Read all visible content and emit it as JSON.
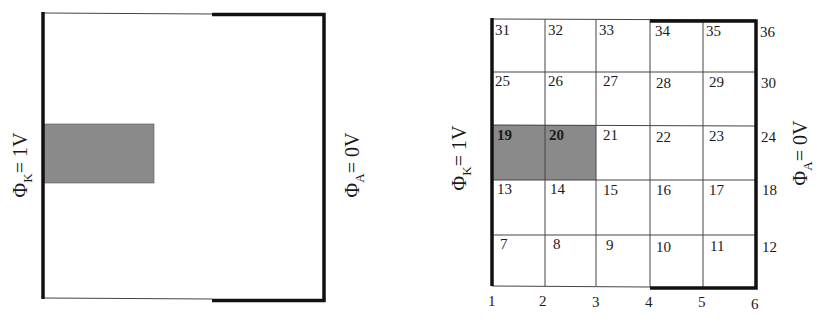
{
  "colors": {
    "line": "#111111",
    "thin_line": "#444444",
    "shaded": "#8a8a8a",
    "background": "#ffffff"
  },
  "left_diagram": {
    "cathode_label": {
      "phi": "Φ",
      "sub": "K",
      "value": "= 1V"
    },
    "anode_label": {
      "phi": "Φ",
      "sub": "A",
      "value": "= 0V"
    }
  },
  "right_diagram": {
    "cathode_label": {
      "phi": "Φ",
      "sub": "K",
      "value": "= 1V"
    },
    "anode_label": {
      "phi": "Φ",
      "sub": "A",
      "value": "= 0V"
    },
    "grid": {
      "columns": 5,
      "rows": 5,
      "cell_labels_top_to_bottom": [
        [
          "31",
          "32",
          "33",
          "34",
          "35"
        ],
        [
          "25",
          "26",
          "27",
          "28",
          "29"
        ],
        [
          "19",
          "20",
          "21",
          "22",
          "23"
        ],
        [
          "13",
          "14",
          "15",
          "16",
          "17"
        ],
        [
          "7",
          "8",
          "9",
          "10",
          "11"
        ]
      ],
      "right_edge_labels_top_to_bottom": [
        "36",
        "30",
        "24",
        "18",
        "12"
      ],
      "bottom_edge_labels": [
        "1",
        "2",
        "3",
        "4",
        "5",
        "6"
      ],
      "shaded_cells": [
        "19",
        "20"
      ]
    }
  }
}
